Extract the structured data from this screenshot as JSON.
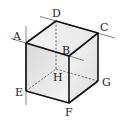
{
  "diagram": {
    "type": "cube",
    "title": "",
    "vertices": {
      "A": {
        "label": "A",
        "x": 26,
        "y": 43
      },
      "B": {
        "label": "B",
        "x": 69,
        "y": 56
      },
      "C": {
        "label": "C",
        "x": 98,
        "y": 33
      },
      "D": {
        "label": "D",
        "x": 56,
        "y": 21
      },
      "E": {
        "label": "E",
        "x": 26,
        "y": 91
      },
      "F": {
        "label": "F",
        "x": 69,
        "y": 103
      },
      "G": {
        "label": "G",
        "x": 98,
        "y": 81
      },
      "H": {
        "label": "H",
        "x": 56,
        "y": 69
      }
    },
    "visible_edges": [
      "AB",
      "BC",
      "CD",
      "DA",
      "AE",
      "BF",
      "CG",
      "EF",
      "FG"
    ],
    "hidden_edges": [
      "DH",
      "EH",
      "HG"
    ],
    "extended_lines": [
      "AE (vertical line through A and E)",
      "AB (line through A and B)",
      "DC (line through D and C)"
    ],
    "colors": {
      "edge": "#111111",
      "hidden_edge": "#555555",
      "extension": "#777777",
      "face_front": "#e4e4e4",
      "face_top": "#f0f0f0",
      "face_right": "#ededed"
    }
  }
}
